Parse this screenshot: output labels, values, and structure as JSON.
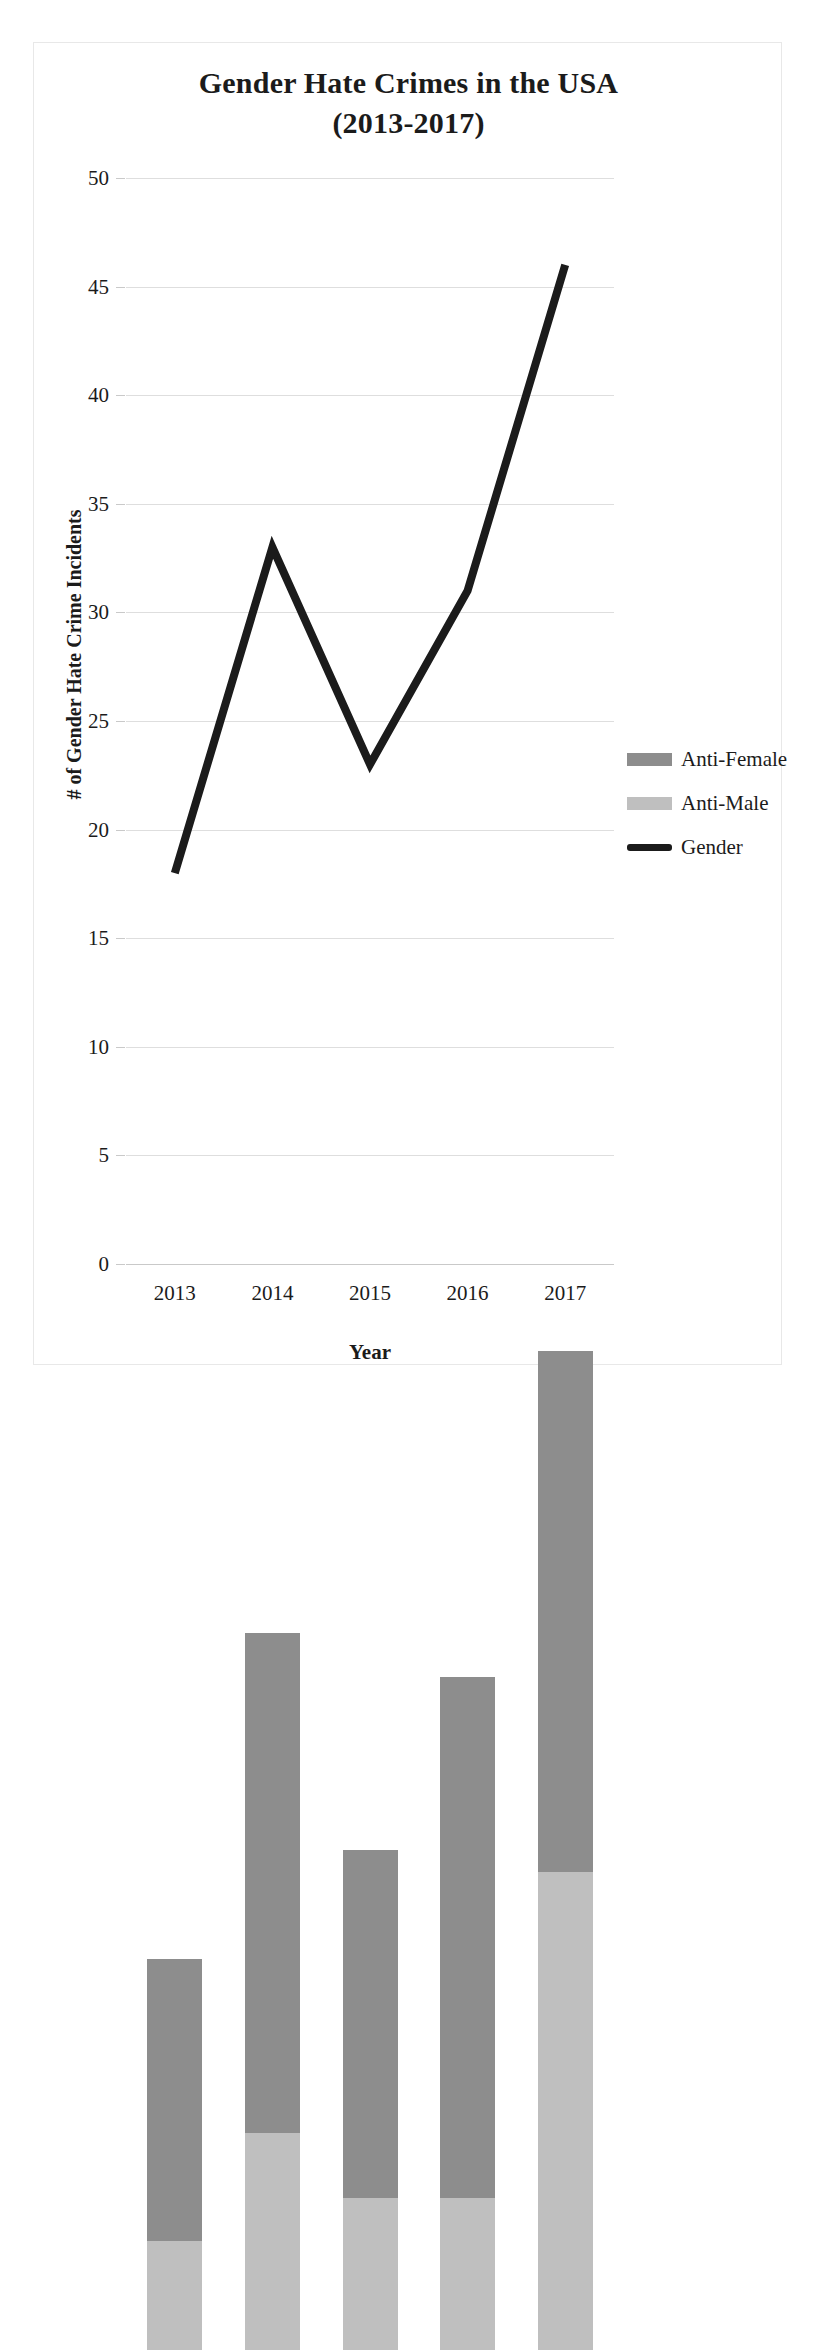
{
  "chart_data": {
    "type": "bar",
    "title": "Gender Hate Crimes in the USA (2013-2017)",
    "title_line1": "Gender Hate Crimes in the USA",
    "title_line2": "(2013-2017)",
    "xlabel": "Year",
    "ylabel": "# of Gender Hate Crime Incidents",
    "categories": [
      "2013",
      "2014",
      "2015",
      "2016",
      "2017"
    ],
    "ylim": [
      0,
      50
    ],
    "ytick_step": 5,
    "ytick_labels": [
      "0",
      "5",
      "10",
      "15",
      "20",
      "25",
      "30",
      "35",
      "40",
      "45",
      "50"
    ],
    "grid": true,
    "stacked": true,
    "legend_position": "right",
    "series": [
      {
        "name": "Anti-Female",
        "kind": "bar-stack",
        "color": "#8d8d8d",
        "values": [
          13,
          23,
          16,
          24,
          24
        ]
      },
      {
        "name": "Anti-Male",
        "kind": "bar-stack",
        "color": "#bfbfbf",
        "values": [
          5,
          10,
          7,
          7,
          22
        ]
      },
      {
        "name": "Gender",
        "kind": "line",
        "color": "#1b1b1b",
        "values": [
          18,
          33,
          23,
          31,
          46
        ]
      }
    ],
    "stack_totals": [
      18,
      33,
      23,
      31,
      46
    ]
  },
  "legend": {
    "items": [
      {
        "label": "Anti-Female",
        "swatch": "dark-gray-swatch"
      },
      {
        "label": "Anti-Male",
        "swatch": "light-gray-swatch"
      },
      {
        "label": "Gender",
        "swatch": "black-line-swatch"
      }
    ]
  }
}
